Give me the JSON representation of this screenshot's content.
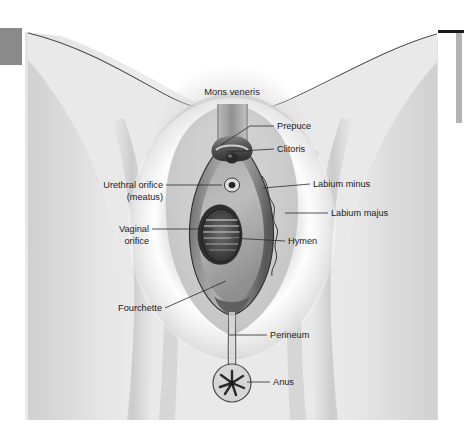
{
  "page": {
    "width": 464,
    "height": 439,
    "background_color": "#ffffff"
  },
  "decorations": {
    "corner_block": {
      "name": "gray-corner-block",
      "color": "#8a8a8a",
      "x": 0,
      "y": 28,
      "width": 22,
      "height": 37
    },
    "top_rule": {
      "name": "top-right-rule",
      "color": "#1a1a1a",
      "x": 435,
      "y": 30,
      "width": 29,
      "height": 3
    },
    "side_bar": {
      "name": "right-side-bar",
      "color": "#b4b4b4",
      "x": 456,
      "y": 33,
      "width": 6,
      "height": 90
    }
  },
  "illustration": {
    "frame": {
      "x": 25,
      "y": 30,
      "width": 413,
      "height": 390
    },
    "skin_light": "#eeeeee",
    "skin_mid": "#dcdcdc",
    "skin_shadow": "#cccccc",
    "thigh_tone": "#d2d2d2",
    "labia_highlight": "#ffffff",
    "labium_majus_tone": "#c9c9c9",
    "labium_minus_tone": "#a8a8a8",
    "vestibule_tone": "#8d8d8d",
    "dark_tone": "#4d4d4d",
    "darkest_tone": "#2e2e2e",
    "outline_color": "#3a3a3a"
  },
  "labels": [
    {
      "id": "mons-veneris",
      "text": "Mons veneris",
      "placement": "arc-top-center",
      "has_leader": false,
      "x": 232,
      "y": 93
    },
    {
      "id": "prepuce",
      "text": "Prepuce",
      "placement": "right",
      "has_leader": true,
      "x": 277,
      "y": 129,
      "leader": "M 274 126 L 248 126 L 220 144"
    },
    {
      "id": "clitoris",
      "text": "Clitoris",
      "placement": "right",
      "has_leader": true,
      "x": 277,
      "y": 152,
      "leader": "M 274 149 L 224 149"
    },
    {
      "id": "urethral-orifice",
      "text": "Urethral orifice",
      "text_line2": "(meatus)",
      "placement": "left",
      "has_leader": true,
      "x": 160,
      "y": 188,
      "x2": 160,
      "y2": 200,
      "leader": "M 163 185 L 219 185"
    },
    {
      "id": "labium-minus",
      "text": "Labium minus",
      "placement": "right",
      "has_leader": true,
      "x": 313,
      "y": 187,
      "leader": "M 310 184 L 243 184"
    },
    {
      "id": "labium-majus",
      "text": "Labium majus",
      "placement": "right",
      "has_leader": true,
      "x": 331,
      "y": 216,
      "leader": "M 328 213 L 283 213"
    },
    {
      "id": "vaginal-orifice",
      "text": "Vaginal",
      "text_line2": "orifice",
      "placement": "left",
      "has_leader": true,
      "x": 148,
      "y": 232,
      "x2": 148,
      "y2": 244,
      "leader": "M 151 229 L 212 229"
    },
    {
      "id": "hymen",
      "text": "Hymen",
      "placement": "right",
      "has_leader": true,
      "x": 288,
      "y": 244,
      "leader": "M 285 241 L 228 241"
    },
    {
      "id": "fourchette",
      "text": "Fourchette",
      "placement": "left",
      "has_leader": true,
      "x": 113,
      "y": 311,
      "leader": "M 163 308 L 224 280"
    },
    {
      "id": "perineum",
      "text": "Perineum",
      "placement": "right",
      "has_leader": true,
      "x": 270,
      "y": 338,
      "leader": "M 267 335 L 222 335"
    },
    {
      "id": "anus",
      "text": "Anus",
      "placement": "right",
      "has_leader": true,
      "x": 273,
      "y": 385,
      "leader": "M 270 382 L 242 382"
    }
  ]
}
